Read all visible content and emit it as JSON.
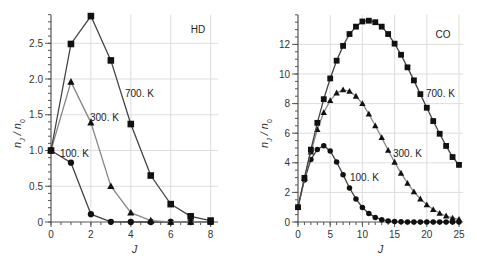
{
  "chart_data": [
    {
      "type": "line",
      "title": "HD",
      "xlabel": "J",
      "ylabel": "n_J / n_0",
      "xlim": [
        0,
        8
      ],
      "ylim": [
        0,
        2.9
      ],
      "xticks": [
        0,
        2,
        4,
        6,
        8
      ],
      "yticks": [
        0,
        0.5,
        1.0,
        1.5,
        2.0,
        2.5
      ],
      "ytick_labels": [
        "0",
        "0.5",
        "1.0",
        "1.5",
        "2.0",
        "2.5"
      ],
      "grid": true,
      "x": [
        0,
        1,
        2,
        3,
        4,
        5,
        6,
        7,
        8
      ],
      "series": [
        {
          "name": "100. K",
          "marker": "circle",
          "values": [
            1.0,
            0.83,
            0.11,
            0.003,
            0.0,
            0.0,
            0.0,
            0.0,
            0.0
          ]
        },
        {
          "name": "300. K",
          "marker": "triangle",
          "values": [
            1.0,
            1.96,
            1.39,
            0.5,
            0.13,
            0.02,
            0.0,
            0.0,
            0.0
          ]
        },
        {
          "name": "700. K",
          "marker": "square",
          "values": [
            1.0,
            2.49,
            2.88,
            2.26,
            1.37,
            0.65,
            0.25,
            0.08,
            0.02
          ]
        }
      ]
    },
    {
      "type": "line",
      "title": "CO",
      "xlabel": "J",
      "ylabel": "n_J / n_0",
      "xlim": [
        0,
        25
      ],
      "ylim": [
        0,
        14
      ],
      "xticks": [
        0,
        5,
        10,
        15,
        20,
        25
      ],
      "yticks": [
        0,
        2,
        4,
        6,
        8,
        10,
        12
      ],
      "grid": true,
      "x": [
        0,
        1,
        2,
        3,
        4,
        5,
        6,
        7,
        8,
        9,
        10,
        11,
        12,
        13,
        14,
        15,
        16,
        17,
        18,
        19,
        20,
        21,
        22,
        23,
        24,
        25
      ],
      "series": [
        {
          "name": "100. K",
          "marker": "circle",
          "values": [
            1.0,
            2.84,
            4.22,
            4.9,
            5.16,
            4.8,
            4.05,
            3.2,
            2.3,
            1.56,
            0.98,
            0.58,
            0.31,
            0.16,
            0.07,
            0.03,
            0.01,
            0,
            0,
            0,
            0,
            0,
            0,
            0,
            0,
            0
          ]
        },
        {
          "name": "300. K",
          "marker": "triangle",
          "values": [
            1.0,
            2.95,
            4.73,
            6.25,
            7.4,
            8.2,
            8.72,
            8.93,
            8.83,
            8.5,
            8.0,
            7.3,
            6.5,
            5.7,
            4.85,
            4.04,
            3.3,
            2.62,
            2.04,
            1.56,
            1.16,
            0.84,
            0.59,
            0.41,
            0.27,
            0.18
          ]
        },
        {
          "name": "700. K",
          "marker": "square",
          "values": [
            1.0,
            2.98,
            4.89,
            6.7,
            8.3,
            9.7,
            10.9,
            11.9,
            12.7,
            13.2,
            13.55,
            13.6,
            13.5,
            13.2,
            12.7,
            12.05,
            11.3,
            10.45,
            9.57,
            8.64,
            7.72,
            6.82,
            5.96,
            5.14,
            4.39,
            3.86
          ]
        }
      ]
    }
  ],
  "labels": {
    "hd": {
      "title": "HD",
      "xlabel": "J",
      "s100": "100. K",
      "s300": "300. K",
      "s700": "700. K"
    },
    "co": {
      "title": "CO",
      "xlabel": "J",
      "s100": "100. K",
      "s300": "300. K",
      "s700": "700. K"
    }
  }
}
